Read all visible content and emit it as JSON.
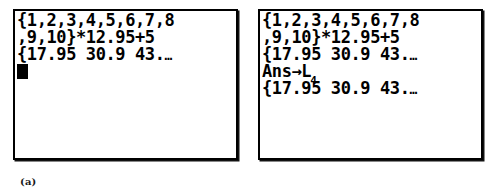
{
  "figure": {
    "panels": [
      {
        "id": "a",
        "caption": "(a)",
        "cursor_visible": true,
        "lines": [
          {
            "text": "{1,2,3,4,5,6,7,8",
            "type": "entry"
          },
          {
            "text": ",9,10}*12.95+5",
            "type": "entry"
          },
          {
            "text": "{17.95 30.9 43.",
            "ellipsis": "…",
            "type": "result"
          }
        ]
      },
      {
        "id": "b",
        "caption": "(b)",
        "cursor_visible": false,
        "lines": [
          {
            "text": "{1,2,3,4,5,6,7,8",
            "type": "entry"
          },
          {
            "text": ",9,10}*12.95+5",
            "type": "entry"
          },
          {
            "text": "{17.95 30.9 43.",
            "ellipsis": "…",
            "type": "result"
          },
          {
            "text": "Ans→L",
            "subscript": "4",
            "type": "entry"
          },
          {
            "text": "{17.95 30.9 43.",
            "ellipsis": "…",
            "type": "result"
          }
        ]
      }
    ],
    "colors": {
      "screen_background": "#ffffff",
      "screen_border": "#000000",
      "text": "#000000",
      "page_background": "#ffffff"
    }
  }
}
